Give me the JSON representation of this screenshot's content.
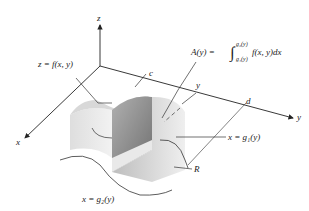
{
  "diagram": {
    "type": "3d-volume-by-cross-sections",
    "axes": {
      "x": "x",
      "y": "y",
      "z": "z"
    },
    "labels": {
      "surface": "z = f(x, y)",
      "area_lhs": "A(y) =",
      "integral_upper": "g₂(y)",
      "integral_lower": "g₁(y)",
      "integrand": "f(x, y)dx",
      "c": "c",
      "d": "d",
      "y_slice": "y",
      "curve1": "x = g₁(y)",
      "curve2": "x = g₂(y)",
      "region": "R"
    },
    "colors": {
      "ink": "#222222",
      "solid_light": "#e6e6e6",
      "solid_mid": "#cfcfcf",
      "section": "#9a9a9a",
      "section_dark": "#7d7d7d"
    }
  }
}
